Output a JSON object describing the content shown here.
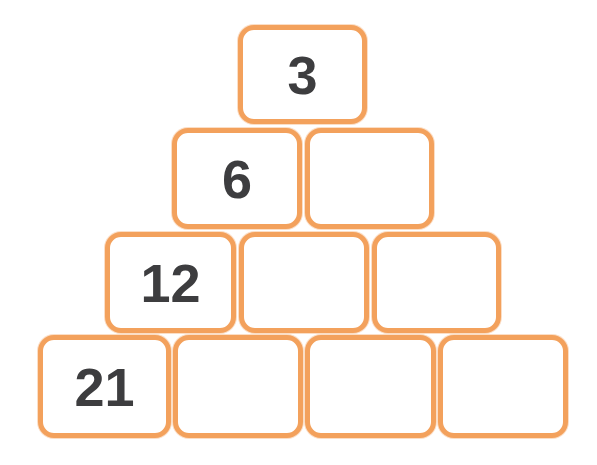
{
  "colors": {
    "border": "#f3a15c",
    "text": "#3d3d3f",
    "fill": "#ffffff"
  },
  "rows": [
    {
      "cells": [
        {
          "value": "3",
          "x": 238,
          "y": 25,
          "w": 129,
          "h": 99
        }
      ]
    },
    {
      "cells": [
        {
          "value": "6",
          "x": 172,
          "y": 128,
          "w": 130,
          "h": 101
        },
        {
          "value": "",
          "x": 305,
          "y": 128,
          "w": 129,
          "h": 101
        }
      ]
    },
    {
      "cells": [
        {
          "value": "12",
          "x": 105,
          "y": 232,
          "w": 131,
          "h": 101
        },
        {
          "value": "",
          "x": 239,
          "y": 232,
          "w": 130,
          "h": 101
        },
        {
          "value": "",
          "x": 372,
          "y": 232,
          "w": 129,
          "h": 101
        }
      ]
    },
    {
      "cells": [
        {
          "value": "21",
          "x": 38,
          "y": 335,
          "w": 133,
          "h": 103
        },
        {
          "value": "",
          "x": 173,
          "y": 335,
          "w": 130,
          "h": 103
        },
        {
          "value": "",
          "x": 305,
          "y": 335,
          "w": 131,
          "h": 103
        },
        {
          "value": "",
          "x": 438,
          "y": 335,
          "w": 130,
          "h": 103
        }
      ]
    }
  ]
}
